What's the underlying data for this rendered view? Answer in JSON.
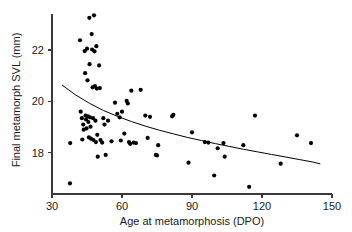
{
  "chart_data": {
    "type": "scatter",
    "title": "",
    "xlabel": "Age at metamorphosis (DPO)",
    "ylabel": "Final metamorph SVL (mm)",
    "xlim": [
      30,
      150
    ],
    "ylim": [
      16.4,
      23.4
    ],
    "xticks": [
      30,
      60,
      90,
      120,
      150
    ],
    "xtick_labels": [
      "30",
      "60",
      "90",
      "120",
      "150"
    ],
    "yticks": [
      18,
      20,
      22
    ],
    "ytick_labels": [
      "18",
      "20",
      "22"
    ],
    "grid": false,
    "legend": "none",
    "marker": "filled-circle",
    "marker_color": "#000000",
    "axis_color": "#3a3a3a",
    "points": [
      [
        37.7,
        16.81
      ],
      [
        37.8,
        18.38
      ],
      [
        42.0,
        22.38
      ],
      [
        42.3,
        19.6
      ],
      [
        42.8,
        19.35
      ],
      [
        43.0,
        18.52
      ],
      [
        43.4,
        19.1
      ],
      [
        43.6,
        18.9
      ],
      [
        44.0,
        21.96
      ],
      [
        44.2,
        21.1
      ],
      [
        44.4,
        19.45
      ],
      [
        44.6,
        19.3
      ],
      [
        44.8,
        18.95
      ],
      [
        45.0,
        22.05
      ],
      [
        45.2,
        20.82
      ],
      [
        45.4,
        19.42
      ],
      [
        45.6,
        19.2
      ],
      [
        45.8,
        18.6
      ],
      [
        46.0,
        23.25
      ],
      [
        46.1,
        21.45
      ],
      [
        46.3,
        19.38
      ],
      [
        46.5,
        19.02
      ],
      [
        46.7,
        18.55
      ],
      [
        47.0,
        22.62
      ],
      [
        47.2,
        22.02
      ],
      [
        47.4,
        20.55
      ],
      [
        47.6,
        19.35
      ],
      [
        47.8,
        18.5
      ],
      [
        48.0,
        23.35
      ],
      [
        48.2,
        21.95
      ],
      [
        48.4,
        20.6
      ],
      [
        48.6,
        19.25
      ],
      [
        48.8,
        18.42
      ],
      [
        49.0,
        22.15
      ],
      [
        49.2,
        20.5
      ],
      [
        49.4,
        18.7
      ],
      [
        49.6,
        17.85
      ],
      [
        50.2,
        21.4
      ],
      [
        50.5,
        20.52
      ],
      [
        50.8,
        18.5
      ],
      [
        51.5,
        18.4
      ],
      [
        52.0,
        19.35
      ],
      [
        52.5,
        19.1
      ],
      [
        53.0,
        17.92
      ],
      [
        54.0,
        19.25
      ],
      [
        55.5,
        18.45
      ],
      [
        57.0,
        19.95
      ],
      [
        58.0,
        19.52
      ],
      [
        59.0,
        19.38
      ],
      [
        59.5,
        18.48
      ],
      [
        60.0,
        19.6
      ],
      [
        61.0,
        18.75
      ],
      [
        62.0,
        20.02
      ],
      [
        62.5,
        19.92
      ],
      [
        63.0,
        18.42
      ],
      [
        63.5,
        18.35
      ],
      [
        64.0,
        20.42
      ],
      [
        65.0,
        18.4
      ],
      [
        66.0,
        18.38
      ],
      [
        68.0,
        20.45
      ],
      [
        70.0,
        19.45
      ],
      [
        71.0,
        18.58
      ],
      [
        72.0,
        19.4
      ],
      [
        74.5,
        17.92
      ],
      [
        75.0,
        17.9
      ],
      [
        75.5,
        18.3
      ],
      [
        81.5,
        19.42
      ],
      [
        82.0,
        19.48
      ],
      [
        88.5,
        17.62
      ],
      [
        90.0,
        18.8
      ],
      [
        95.5,
        18.42
      ],
      [
        97.0,
        18.4
      ],
      [
        99.5,
        17.12
      ],
      [
        101.0,
        18.18
      ],
      [
        103.5,
        18.38
      ],
      [
        104.0,
        17.85
      ],
      [
        112.0,
        18.3
      ],
      [
        114.5,
        16.68
      ],
      [
        117.0,
        19.45
      ],
      [
        128.0,
        17.58
      ],
      [
        135.0,
        18.68
      ],
      [
        141.0,
        18.38
      ]
    ],
    "fit_curve": {
      "type": "decreasing-power-curve",
      "x_start": 34.3,
      "x_end": 145.0,
      "y_start": 20.64,
      "y_end": 17.57,
      "sampled": [
        [
          34.3,
          20.64
        ],
        [
          40.0,
          20.26
        ],
        [
          46.0,
          19.93
        ],
        [
          52.0,
          19.65
        ],
        [
          58.0,
          19.42
        ],
        [
          64.0,
          19.22
        ],
        [
          70.0,
          19.04
        ],
        [
          76.0,
          18.88
        ],
        [
          82.0,
          18.74
        ],
        [
          88.0,
          18.6
        ],
        [
          94.0,
          18.48
        ],
        [
          100.0,
          18.36
        ],
        [
          106.0,
          18.25
        ],
        [
          112.0,
          18.14
        ],
        [
          118.0,
          18.04
        ],
        [
          124.0,
          17.94
        ],
        [
          130.0,
          17.84
        ],
        [
          136.0,
          17.74
        ],
        [
          142.0,
          17.64
        ],
        [
          145.0,
          17.57
        ]
      ]
    }
  }
}
